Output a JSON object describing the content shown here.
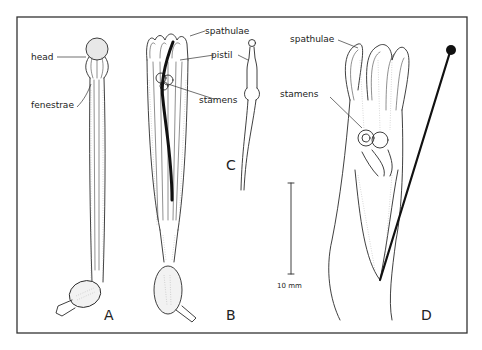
{
  "figure": {
    "panels": [
      {
        "id": "A",
        "label": "A"
      },
      {
        "id": "B",
        "label": "B"
      },
      {
        "id": "C",
        "label": "C"
      },
      {
        "id": "D",
        "label": "D"
      }
    ],
    "annotations": {
      "head": "head",
      "fenestrae": "fenestrae",
      "spathulae_b": "spathulae",
      "pistil": "pistil",
      "stamens_b": "stamens",
      "spathulae_d": "spathulae",
      "stamens_d": "stamens"
    },
    "scale_bar": {
      "label": "10 mm"
    }
  }
}
